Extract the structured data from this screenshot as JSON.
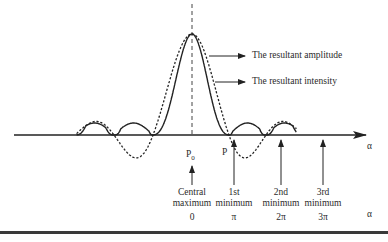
{
  "diagram": {
    "legend": [
      {
        "label": "The resultant amplitude",
        "style": "dashed"
      },
      {
        "label": "The resultant intensity",
        "style": "solid"
      }
    ],
    "axis_label": "α",
    "points": {
      "p0": "P",
      "p0_sub": "0",
      "p": "P"
    },
    "markers": [
      {
        "line1": "Central",
        "line2": "maximum",
        "value": "0"
      },
      {
        "line1": "1st",
        "line2": "minimum",
        "value": "π"
      },
      {
        "line1": "2nd",
        "line2": "minimum",
        "value": "2π"
      },
      {
        "line1": "3rd",
        "line2": "minimum",
        "value": "3π"
      }
    ],
    "bottom_axis_label": "α",
    "colors": {
      "line": "#222222",
      "background": "#ffffff"
    }
  }
}
